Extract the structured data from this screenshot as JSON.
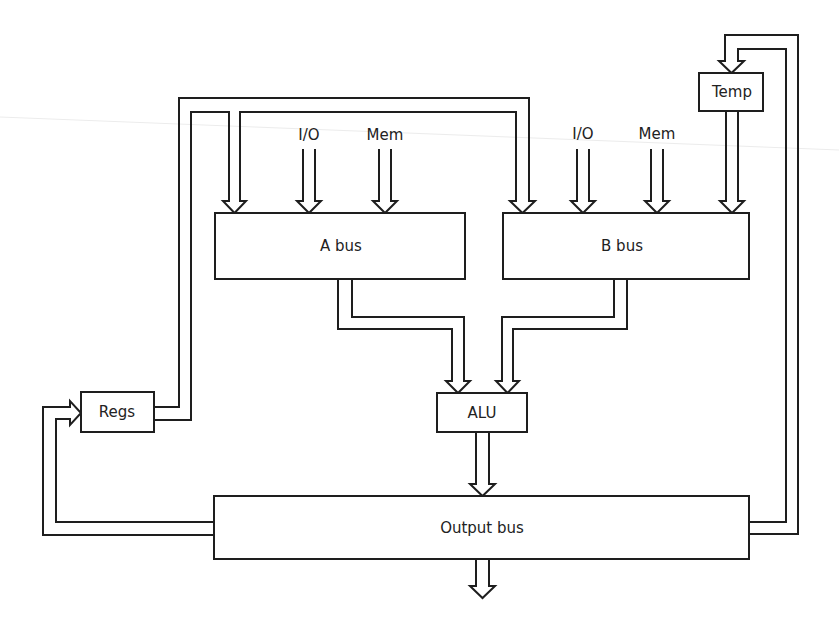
{
  "diagram": {
    "nodes": {
      "a_bus": "A bus",
      "b_bus": "B bus",
      "alu": "ALU",
      "output_bus": "Output bus",
      "regs": "Regs",
      "temp": "Temp"
    },
    "input_labels": {
      "a_io": "I/O",
      "a_mem": "Mem",
      "b_io": "I/O",
      "b_mem": "Mem"
    },
    "edges": [
      {
        "from": "I/O",
        "to": "A bus"
      },
      {
        "from": "Mem",
        "to": "A bus"
      },
      {
        "from": "Regs",
        "to": "A bus"
      },
      {
        "from": "Regs",
        "to": "B bus"
      },
      {
        "from": "I/O",
        "to": "B bus"
      },
      {
        "from": "Mem",
        "to": "B bus"
      },
      {
        "from": "Temp",
        "to": "B bus"
      },
      {
        "from": "A bus",
        "to": "ALU"
      },
      {
        "from": "B bus",
        "to": "ALU"
      },
      {
        "from": "ALU",
        "to": "Output bus"
      },
      {
        "from": "Output bus",
        "to": "Regs"
      },
      {
        "from": "Output bus",
        "to": "Temp"
      },
      {
        "from": "Output bus",
        "to": "external output"
      }
    ]
  },
  "colors": {
    "stroke": "#1e1e1e",
    "text": "#222222",
    "background": "#ffffff"
  }
}
